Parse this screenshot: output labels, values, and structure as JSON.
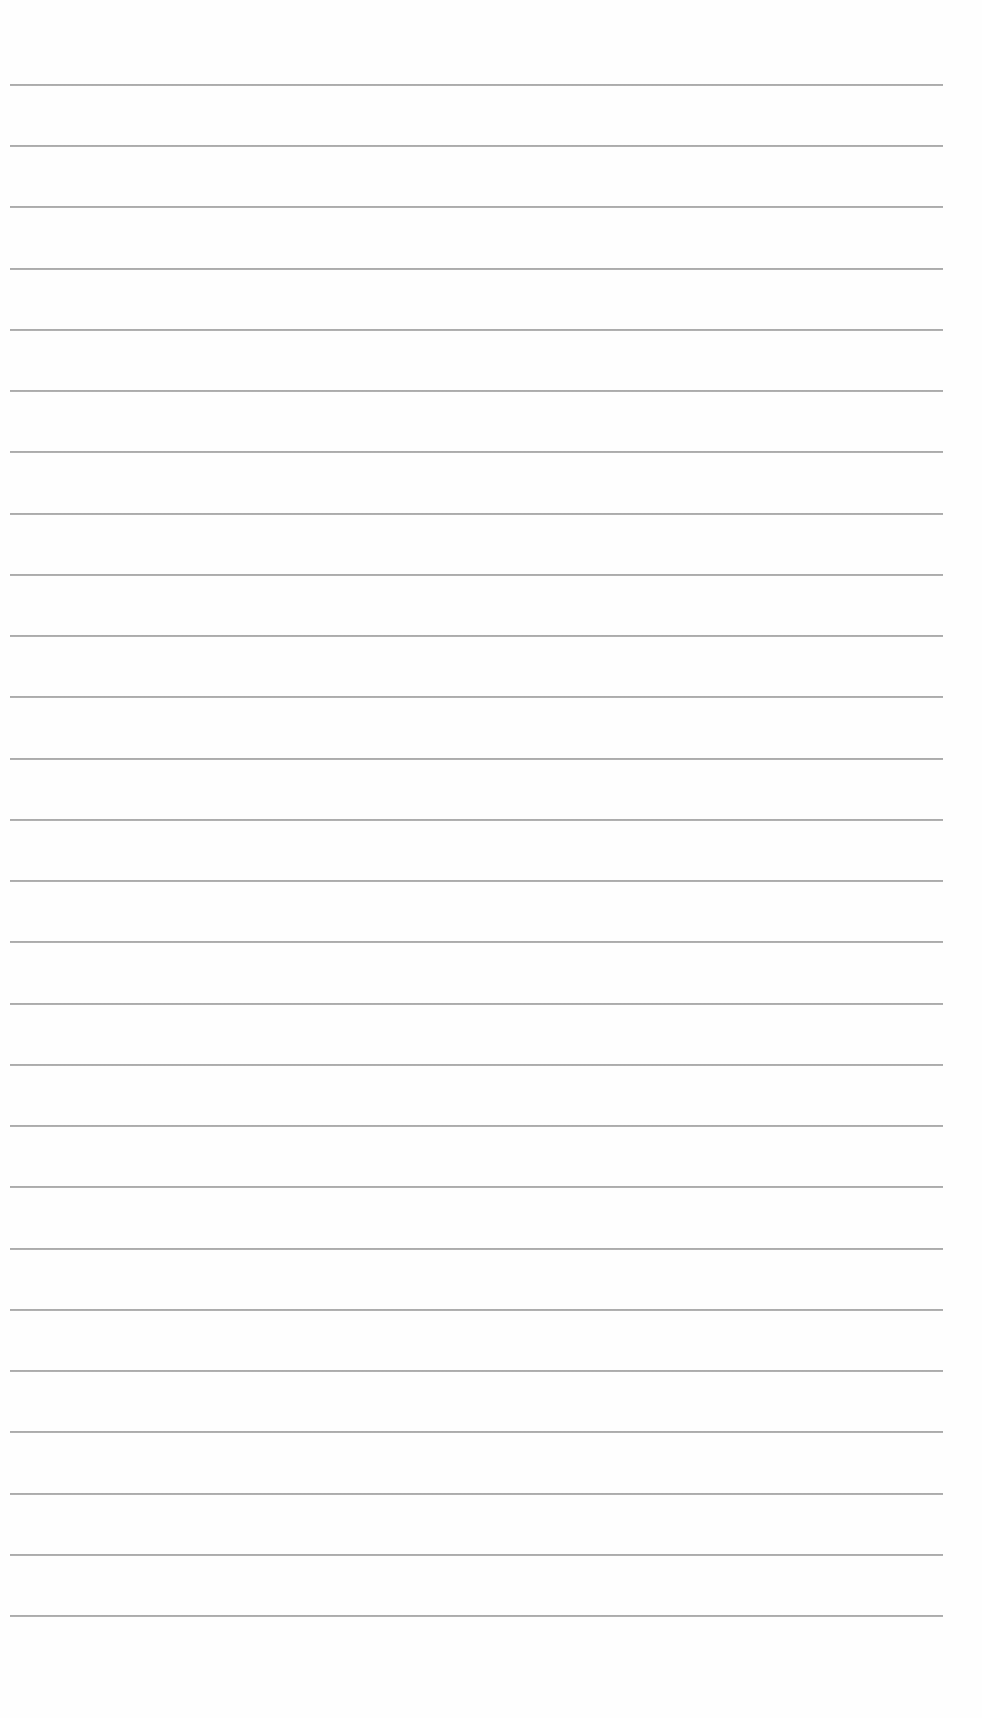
{
  "page": {
    "type": "blank-lined-paper",
    "background_color": "#fefefe",
    "rule_color": "#999999",
    "rule_count": 26,
    "rule_left": 10,
    "rule_right": 943,
    "first_rule_y": 85,
    "rule_spacing": 61.24
  }
}
